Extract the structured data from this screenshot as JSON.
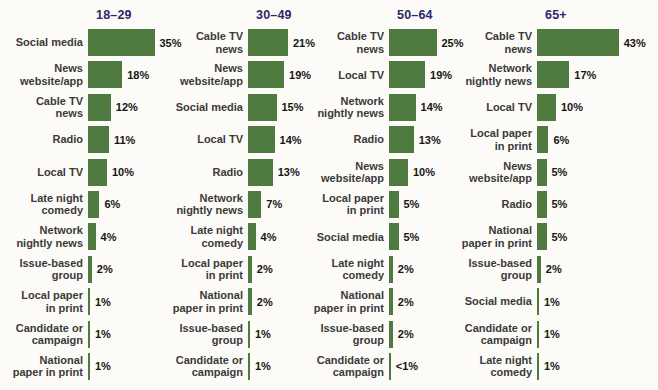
{
  "colors": {
    "bar": "#4e7a40",
    "header": "#2b2968",
    "label": "#3a3a3a",
    "value": "#161616",
    "background": "#fcfbf7"
  },
  "chart_data": {
    "type": "bar",
    "orientation": "horizontal",
    "unit": "percent",
    "value_range": [
      0,
      43
    ],
    "grid": false,
    "legend": "none",
    "groups": [
      {
        "header": "18–29",
        "rows": [
          {
            "label": "Social media",
            "value": 35,
            "value_label": "35%"
          },
          {
            "label": "News\nwebsite/app",
            "value": 18,
            "value_label": "18%"
          },
          {
            "label": "Cable TV\nnews",
            "value": 12,
            "value_label": "12%"
          },
          {
            "label": "Radio",
            "value": 11,
            "value_label": "11%"
          },
          {
            "label": "Local TV",
            "value": 10,
            "value_label": "10%"
          },
          {
            "label": "Late night\ncomedy",
            "value": 6,
            "value_label": "6%"
          },
          {
            "label": "Network\nnightly news",
            "value": 4,
            "value_label": "4%"
          },
          {
            "label": "Issue-based\ngroup",
            "value": 2,
            "value_label": "2%"
          },
          {
            "label": "Local paper\nin print",
            "value": 1,
            "value_label": "1%"
          },
          {
            "label": "Candidate or\ncampaign",
            "value": 1,
            "value_label": "1%"
          },
          {
            "label": "National\npaper in print",
            "value": 1,
            "value_label": "1%"
          }
        ]
      },
      {
        "header": "30–49",
        "rows": [
          {
            "label": "Cable TV\nnews",
            "value": 21,
            "value_label": "21%"
          },
          {
            "label": "News\nwebsite/app",
            "value": 19,
            "value_label": "19%"
          },
          {
            "label": "Social media",
            "value": 15,
            "value_label": "15%"
          },
          {
            "label": "Local TV",
            "value": 14,
            "value_label": "14%"
          },
          {
            "label": "Radio",
            "value": 13,
            "value_label": "13%"
          },
          {
            "label": "Network\nnightly news",
            "value": 7,
            "value_label": "7%"
          },
          {
            "label": "Late night\ncomedy",
            "value": 4,
            "value_label": "4%"
          },
          {
            "label": "Local paper\nin print",
            "value": 2,
            "value_label": "2%"
          },
          {
            "label": "National\npaper in print",
            "value": 2,
            "value_label": "2%"
          },
          {
            "label": "Issue-based\ngroup",
            "value": 1,
            "value_label": "1%"
          },
          {
            "label": "Candidate or\ncampaign",
            "value": 1,
            "value_label": "1%"
          }
        ]
      },
      {
        "header": "50–64",
        "rows": [
          {
            "label": "Cable TV\nnews",
            "value": 25,
            "value_label": "25%"
          },
          {
            "label": "Local TV",
            "value": 19,
            "value_label": "19%"
          },
          {
            "label": "Network\nnightly news",
            "value": 14,
            "value_label": "14%"
          },
          {
            "label": "Radio",
            "value": 13,
            "value_label": "13%"
          },
          {
            "label": "News\nwebsite/app",
            "value": 10,
            "value_label": "10%"
          },
          {
            "label": "Local paper\nin print",
            "value": 5,
            "value_label": "5%"
          },
          {
            "label": "Social media",
            "value": 5,
            "value_label": "5%"
          },
          {
            "label": "Late night\ncomedy",
            "value": 2,
            "value_label": "2%"
          },
          {
            "label": "National\npaper in print",
            "value": 2,
            "value_label": "2%"
          },
          {
            "label": "Issue-based\ngroup",
            "value": 2,
            "value_label": "2%"
          },
          {
            "label": "Candidate or\ncampaign",
            "value": 0.5,
            "value_label": "<1%"
          }
        ]
      },
      {
        "header": "65+",
        "rows": [
          {
            "label": "Cable TV\nnews",
            "value": 43,
            "value_label": "43%"
          },
          {
            "label": "Network\nnightly news",
            "value": 17,
            "value_label": "17%"
          },
          {
            "label": "Local TV",
            "value": 10,
            "value_label": "10%"
          },
          {
            "label": "Local paper\nin print",
            "value": 6,
            "value_label": "6%"
          },
          {
            "label": "News\nwebsite/app",
            "value": 5,
            "value_label": "5%"
          },
          {
            "label": "Radio",
            "value": 5,
            "value_label": "5%"
          },
          {
            "label": "National\npaper in print",
            "value": 5,
            "value_label": "5%"
          },
          {
            "label": "Issue-based\ngroup",
            "value": 2,
            "value_label": "2%"
          },
          {
            "label": "Social media",
            "value": 1,
            "value_label": "1%"
          },
          {
            "label": "Candidate or\ncampaign",
            "value": 1,
            "value_label": "1%"
          },
          {
            "label": "Late night\ncomedy",
            "value": 1,
            "value_label": "1%"
          }
        ]
      }
    ]
  }
}
